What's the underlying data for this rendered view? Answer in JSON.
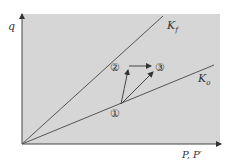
{
  "diagram": {
    "y_axis_label": "q",
    "x_axis_label": "P, P′",
    "lines": [
      {
        "name": "K_f",
        "label_main": "K",
        "label_sub": "f"
      },
      {
        "name": "K_o",
        "label_main": "K",
        "label_sub": "o"
      }
    ],
    "points": [
      {
        "id": "1",
        "label": "①"
      },
      {
        "id": "2",
        "label": "②"
      },
      {
        "id": "3",
        "label": "③"
      }
    ],
    "colors": {
      "background": "#d6d6d6",
      "line": "#555555"
    }
  }
}
